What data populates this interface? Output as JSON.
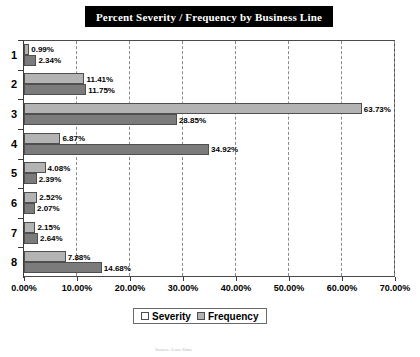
{
  "title": "Percent Severity / Frequency by Business Line",
  "footer_note": "Source: Loss Data",
  "legend": {
    "items": [
      {
        "label": "Severity",
        "color": "#7b7b7b",
        "key": "severity"
      },
      {
        "label": "Frequency",
        "color": "#b3b3b3",
        "key": "frequency"
      }
    ]
  },
  "axis": {
    "x_tick_labels": [
      "0.00%",
      "10.00%",
      "20.00%",
      "30.00%",
      "40.00%",
      "50.00%",
      "60.00%",
      "70.00%"
    ],
    "y_tick_labels": [
      "1",
      "2",
      "3",
      "4",
      "5",
      "6",
      "7",
      "8"
    ]
  },
  "chart_data": {
    "type": "bar",
    "orientation": "horizontal",
    "title": "Percent Severity / Frequency by Business Line",
    "xlabel": "",
    "ylabel": "",
    "xlim": [
      0,
      70
    ],
    "xtick_step": 10,
    "grid": true,
    "grid_axis": "x",
    "grid_style": "dashed",
    "legend_position": "bottom",
    "categories": [
      "1",
      "2",
      "3",
      "4",
      "5",
      "6",
      "7",
      "8"
    ],
    "series": [
      {
        "name": "Frequency",
        "color": "#b3b3b3",
        "values": [
          0.99,
          11.41,
          63.73,
          6.87,
          4.08,
          2.52,
          2.15,
          7.88
        ],
        "labels": [
          "0.99%",
          "11.41%",
          "63.73%",
          "6.87%",
          "4.08%",
          "2.52%",
          "2.15%",
          "7.88%"
        ]
      },
      {
        "name": "Severity",
        "color": "#7b7b7b",
        "values": [
          2.34,
          11.75,
          28.85,
          34.92,
          2.39,
          2.07,
          2.64,
          14.68
        ],
        "labels": [
          "2.34%",
          "11.75%",
          "28.85%",
          "34.92%",
          "2.39%",
          "2.07%",
          "2.64%",
          "14.68%"
        ]
      }
    ]
  }
}
